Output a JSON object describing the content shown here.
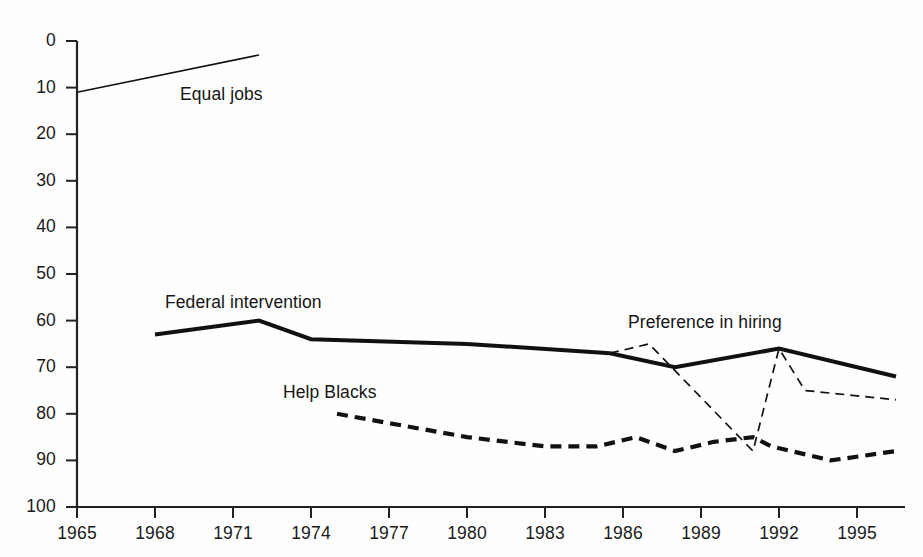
{
  "chart_data": {
    "type": "line",
    "title": "",
    "subtitle": "",
    "xlabel": "",
    "ylabel": "",
    "xlim": [
      1965,
      1996.5
    ],
    "ylim": [
      0,
      100
    ],
    "grid": false,
    "legend": "inline-labels",
    "x_ticks": [
      "1965",
      "1968",
      "1971",
      "1974",
      "1977",
      "1980",
      "1983",
      "1986",
      "1989",
      "1992",
      "1995"
    ],
    "y_ticks": [
      "0",
      "10",
      "20",
      "30",
      "40",
      "50",
      "60",
      "70",
      "80",
      "90",
      "100"
    ],
    "series": [
      {
        "name": "Equal jobs",
        "style": "thin-solid",
        "label_position": {
          "x": 180,
          "y": 84
        },
        "points": [
          {
            "x": 1965,
            "y": 89
          },
          {
            "x": 1972,
            "y": 97
          }
        ]
      },
      {
        "name": "Federal intervention",
        "style": "thick-solid",
        "label_position": {
          "x": 165,
          "y": 292
        },
        "points": [
          {
            "x": 1968,
            "y": 37
          },
          {
            "x": 1972,
            "y": 40
          },
          {
            "x": 1974,
            "y": 36
          },
          {
            "x": 1980,
            "y": 35
          },
          {
            "x": 1985.5,
            "y": 33
          },
          {
            "x": 1988,
            "y": 30
          },
          {
            "x": 1992,
            "y": 34
          },
          {
            "x": 1996.5,
            "y": 28
          }
        ]
      },
      {
        "name": "Preference in hiring",
        "style": "thin-dashed",
        "label_position": {
          "x": 628,
          "y": 312
        },
        "points": [
          {
            "x": 1985.5,
            "y": 33
          },
          {
            "x": 1987,
            "y": 35
          },
          {
            "x": 1991,
            "y": 12
          },
          {
            "x": 1992,
            "y": 34
          },
          {
            "x": 1993,
            "y": 25
          },
          {
            "x": 1996.5,
            "y": 23
          }
        ]
      },
      {
        "name": "Help Blacks",
        "style": "thick-dashed",
        "label_position": {
          "x": 283,
          "y": 382
        },
        "points": [
          {
            "x": 1975,
            "y": 20
          },
          {
            "x": 1980,
            "y": 15
          },
          {
            "x": 1983,
            "y": 13
          },
          {
            "x": 1985,
            "y": 13
          },
          {
            "x": 1986.5,
            "y": 15
          },
          {
            "x": 1988,
            "y": 12
          },
          {
            "x": 1989.5,
            "y": 14
          },
          {
            "x": 1991,
            "y": 15
          },
          {
            "x": 1991.7,
            "y": 13
          },
          {
            "x": 1994,
            "y": 10
          },
          {
            "x": 1996.5,
            "y": 12
          }
        ]
      }
    ]
  },
  "axes": {
    "y_tick_values": [
      100,
      90,
      80,
      70,
      60,
      50,
      40,
      30,
      20,
      10,
      0
    ],
    "x_tick_values": [
      1965,
      1968,
      1971,
      1974,
      1977,
      1980,
      1983,
      1986,
      1989,
      1992,
      1995
    ],
    "axis_color": "#222222"
  },
  "labels": {
    "equal_jobs": "Equal jobs",
    "federal_intervention": "Federal intervention",
    "preference_in_hiring": "Preference in hiring",
    "help_blacks": "Help Blacks"
  }
}
